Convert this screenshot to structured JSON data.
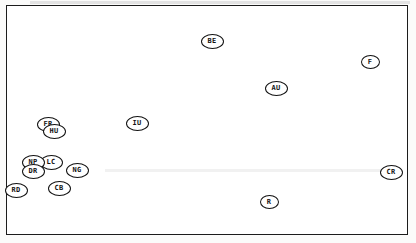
{
  "chart_data": {
    "type": "scatter",
    "title": "",
    "xlabel": "",
    "ylabel": "",
    "axes_visible": false,
    "grid": false,
    "legend": null,
    "units": "px",
    "marker_style": "ellipse-outline with bold two-letter code inside",
    "points": [
      {
        "label": "BE",
        "x": 212,
        "y": 41
      },
      {
        "label": "F",
        "x": 370,
        "y": 62
      },
      {
        "label": "AU",
        "x": 276,
        "y": 88
      },
      {
        "label": "IU",
        "x": 137,
        "y": 123
      },
      {
        "label": "FR",
        "x": 48,
        "y": 124
      },
      {
        "label": "HU",
        "x": 54,
        "y": 131
      },
      {
        "label": "LC",
        "x": 51,
        "y": 162
      },
      {
        "label": "NP",
        "x": 33,
        "y": 162
      },
      {
        "label": "DR",
        "x": 33,
        "y": 171
      },
      {
        "label": "NG",
        "x": 77,
        "y": 170
      },
      {
        "label": "RD",
        "x": 16,
        "y": 190
      },
      {
        "label": "CB",
        "x": 59,
        "y": 188
      },
      {
        "label": "CR",
        "x": 391,
        "y": 172
      },
      {
        "label": "R",
        "x": 269,
        "y": 202
      }
    ],
    "colors": {
      "stroke": "#111111",
      "background": "#ffffff",
      "frame": "#1c1c1c"
    }
  }
}
